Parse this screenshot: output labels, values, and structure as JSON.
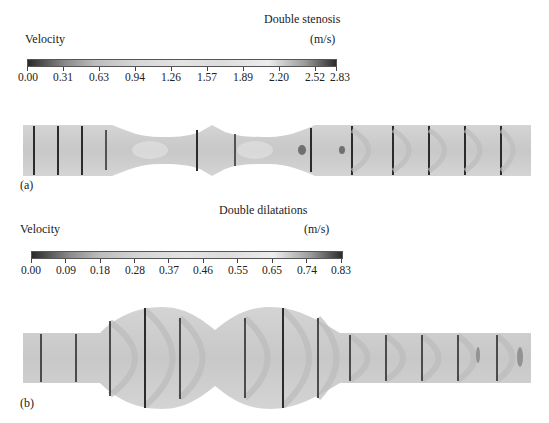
{
  "panel_a": {
    "title": "Double stenosis",
    "colorbar_label": "Velocity",
    "unit": "(m/s)",
    "ticks": [
      "0.00",
      "0.31",
      "0.63",
      "0.94",
      "1.26",
      "1.57",
      "1.89",
      "2.20",
      "2.52",
      "2.83"
    ],
    "range": [
      0.0,
      2.83
    ],
    "panel_label": "(a)"
  },
  "panel_b": {
    "title": "Double dilatations",
    "colorbar_label": "Velocity",
    "unit": "(m/s)",
    "ticks": [
      "0.00",
      "0.09",
      "0.18",
      "0.28",
      "0.37",
      "0.46",
      "0.55",
      "0.65",
      "0.74",
      "0.83"
    ],
    "range": [
      0.0,
      0.83
    ],
    "panel_label": "(b)"
  },
  "colors": {
    "colormap_low": "#2a2a2a",
    "colormap_mid": "#e4e4e4",
    "colormap_high": "#2c2c2c",
    "vessel_fill": "#d9d9d9",
    "profile_line": "#2b2b2b"
  }
}
